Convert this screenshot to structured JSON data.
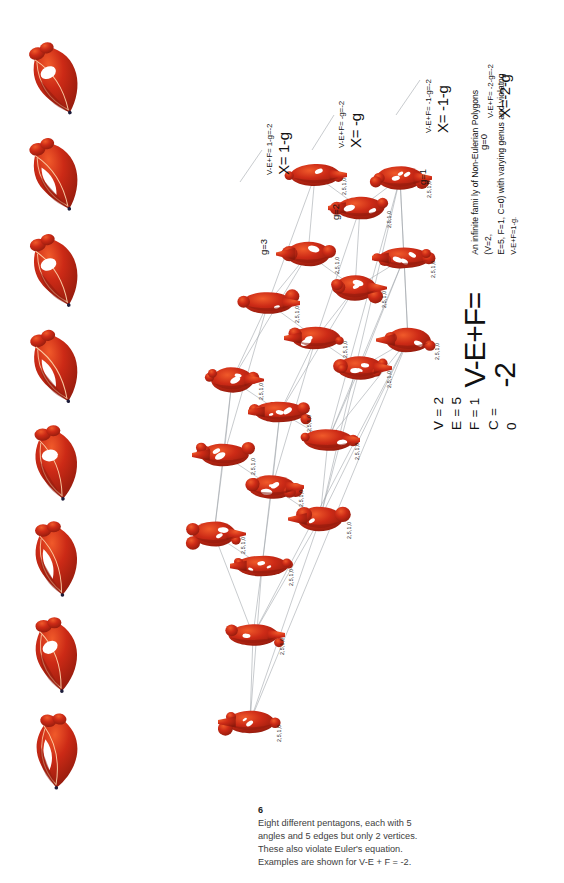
{
  "figure": {
    "title_equation": "V-E+F= -2",
    "variables": [
      "V = 2",
      "E = 5",
      "F = 1",
      "C = 0"
    ],
    "description_lines": [
      "An infinite fami ly of Non-Eulerian Polygons (V=2,",
      "E=5, F=1, C=0) with varying genus and violatng"
    ],
    "description_last_line": "V-E+F=1-g.",
    "node_label": "2,5,1,0",
    "shape_color": "#cc2a16",
    "shape_color_dark": "#8e1a0c",
    "shape_color_light": "#f05a2a",
    "edge_color": "#9aa0a6"
  },
  "caption": {
    "number": "6",
    "lines": [
      "Eight different pentagons, each with 5",
      "angles and 5 edges but only 2 vertices.",
      "These also violate Euler's equation.",
      "Examples are shown for V-E + F = -2."
    ]
  },
  "genus_callouts": [
    {
      "id": "g3",
      "genus_label": "g=3",
      "equation_small": "V-E+F= 1-g=-2",
      "equation_big": "X= 1-g"
    },
    {
      "id": "g2",
      "genus_label": "g=2",
      "equation_small": "V-E+F= -g=-2",
      "equation_big": "X= -g"
    },
    {
      "id": "g1",
      "genus_label": "g=1",
      "equation_small": "V-E+F= -1-g=-2",
      "equation_big": "X= -1-g"
    },
    {
      "id": "g0",
      "genus_label": "g=0",
      "equation_small": "V-E+F= -2-g=-2",
      "equation_big": "X=-2-g"
    }
  ],
  "specimens": [
    {
      "id": "specimen-1",
      "variant": 0
    },
    {
      "id": "specimen-2",
      "variant": 1
    },
    {
      "id": "specimen-3",
      "variant": 2
    },
    {
      "id": "specimen-4",
      "variant": 3
    },
    {
      "id": "specimen-5",
      "variant": 4
    },
    {
      "id": "specimen-6",
      "variant": 5
    },
    {
      "id": "specimen-7",
      "variant": 6
    },
    {
      "id": "specimen-8",
      "variant": 7
    }
  ],
  "lattice_nodes": [
    {
      "id": "n1",
      "x": 195,
      "y": 175,
      "variant": 0
    },
    {
      "id": "n2",
      "x": 240,
      "y": 208,
      "variant": 1
    },
    {
      "id": "n3",
      "x": 280,
      "y": 178,
      "variant": 2
    },
    {
      "id": "n4",
      "x": 188,
      "y": 254,
      "variant": 3
    },
    {
      "id": "n5",
      "x": 235,
      "y": 288,
      "variant": 4
    },
    {
      "id": "n6",
      "x": 284,
      "y": 258,
      "variant": 5
    },
    {
      "id": "n7",
      "x": 148,
      "y": 303,
      "variant": 6
    },
    {
      "id": "n8",
      "x": 196,
      "y": 338,
      "variant": 7
    },
    {
      "id": "n9",
      "x": 240,
      "y": 368,
      "variant": 8
    },
    {
      "id": "n10",
      "x": 288,
      "y": 340,
      "variant": 9
    },
    {
      "id": "n11",
      "x": 112,
      "y": 380,
      "variant": 10
    },
    {
      "id": "n12",
      "x": 160,
      "y": 412,
      "variant": 11
    },
    {
      "id": "n13",
      "x": 208,
      "y": 440,
      "variant": 12
    },
    {
      "id": "n14",
      "x": 104,
      "y": 455,
      "variant": 13
    },
    {
      "id": "n15",
      "x": 152,
      "y": 487,
      "variant": 14
    },
    {
      "id": "n16",
      "x": 200,
      "y": 519,
      "variant": 15
    },
    {
      "id": "n17",
      "x": 94,
      "y": 534,
      "variant": 16
    },
    {
      "id": "n18",
      "x": 142,
      "y": 566,
      "variant": 17
    },
    {
      "id": "n19",
      "x": 133,
      "y": 635,
      "variant": 18
    },
    {
      "id": "n20",
      "x": 130,
      "y": 722,
      "variant": 19
    }
  ],
  "lattice_edges": [
    [
      "n1",
      "n2"
    ],
    [
      "n2",
      "n3"
    ],
    [
      "n1",
      "n4"
    ],
    [
      "n2",
      "n5"
    ],
    [
      "n3",
      "n6"
    ],
    [
      "n4",
      "n5"
    ],
    [
      "n5",
      "n6"
    ],
    [
      "n4",
      "n7"
    ],
    [
      "n5",
      "n8"
    ],
    [
      "n6",
      "n9"
    ],
    [
      "n7",
      "n8"
    ],
    [
      "n8",
      "n9"
    ],
    [
      "n9",
      "n10"
    ],
    [
      "n6",
      "n10"
    ],
    [
      "n3",
      "n10"
    ],
    [
      "n7",
      "n11"
    ],
    [
      "n8",
      "n12"
    ],
    [
      "n9",
      "n13"
    ],
    [
      "n11",
      "n12"
    ],
    [
      "n12",
      "n13"
    ],
    [
      "n11",
      "n14"
    ],
    [
      "n12",
      "n15"
    ],
    [
      "n13",
      "n16"
    ],
    [
      "n14",
      "n15"
    ],
    [
      "n15",
      "n16"
    ],
    [
      "n14",
      "n17"
    ],
    [
      "n15",
      "n18"
    ],
    [
      "n17",
      "n18"
    ],
    [
      "n16",
      "n10"
    ],
    [
      "n13",
      "n10"
    ],
    [
      "n18",
      "n19"
    ],
    [
      "n17",
      "n19"
    ],
    [
      "n16",
      "n19"
    ],
    [
      "n19",
      "n20"
    ],
    [
      "n18",
      "n20"
    ],
    [
      "n16",
      "n20"
    ],
    [
      "n10",
      "n20"
    ],
    [
      "n10",
      "n19"
    ],
    [
      "n3",
      "n13"
    ],
    [
      "n3",
      "n16"
    ],
    [
      "n1",
      "n7"
    ],
    [
      "n4",
      "n11"
    ],
    [
      "n7",
      "n14"
    ],
    [
      "n11",
      "n17"
    ],
    [
      "n2",
      "n8"
    ],
    [
      "n5",
      "n12"
    ],
    [
      "n8",
      "n15"
    ],
    [
      "n12",
      "n18"
    ],
    [
      "n6",
      "n13"
    ],
    [
      "n9",
      "n16"
    ]
  ]
}
